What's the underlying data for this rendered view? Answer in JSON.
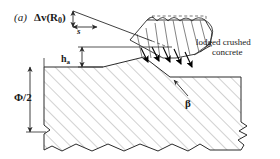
{
  "figure": {
    "panel_label": "(a)",
    "domain": "structural-engineering-diagram",
    "background": "#ffffff",
    "ink_color": "#2a2a2a",
    "hatch_color": "#9a9a9a",
    "arrow_fill": "#000000"
  },
  "labels": {
    "delta_v": "Δv(R",
    "delta_v_sub": "0",
    "delta_v_close": ")",
    "slip": "s",
    "ha": "h",
    "ha_sub": "a",
    "phi_half": "Φ/2",
    "beta": "β",
    "lodged_line1": "lodged crushed",
    "lodged_line2": "concrete"
  },
  "annotations": {
    "arrow_count": 5,
    "arrow_direction": "down-right",
    "break_line_bottom": true,
    "break_line_right": true,
    "hatch_angle_deg": 45
  }
}
